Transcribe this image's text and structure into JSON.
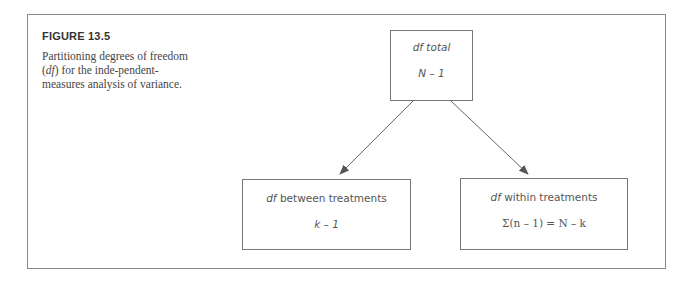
{
  "figure": {
    "label": "FIGURE 13.5",
    "caption_pre": "Partitioning degrees of freedom (",
    "caption_italic": "df",
    "caption_post": ") for the inde-pendent-measures analysis of variance."
  },
  "nodes": {
    "total": {
      "title_italic": "df",
      "title_rest": " total",
      "formula": "N – 1"
    },
    "between": {
      "title_italic": "df",
      "title_rest": " between treatments",
      "formula": "k – 1"
    },
    "within": {
      "title_italic": "df",
      "title_rest": " within treatments",
      "formula": "Σ(n – 1) = N – k"
    }
  },
  "edges": [
    {
      "from": "total",
      "to": "between"
    },
    {
      "from": "total",
      "to": "within"
    }
  ],
  "colors": {
    "line": "#666666",
    "text": "#555555",
    "frame": "#8a8a8a"
  }
}
